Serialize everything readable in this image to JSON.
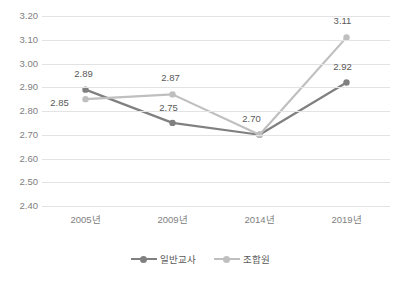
{
  "chart_data": {
    "type": "line",
    "title": "",
    "xlabel": "",
    "ylabel": "",
    "categories": [
      "2005년",
      "2009년",
      "2014년",
      "2019년"
    ],
    "ylim": [
      2.4,
      3.2
    ],
    "ytick_step": 0.1,
    "ytick_labels": [
      "3.20",
      "3.10",
      "3.00",
      "2.90",
      "2.80",
      "2.70",
      "2.60",
      "2.50",
      "2.40"
    ],
    "grid": "horizontal",
    "legend_position": "bottom-center",
    "series": [
      {
        "name": "일반교사",
        "color": "#808080",
        "marker": "circle",
        "values": [
          2.89,
          2.75,
          2.7,
          2.92
        ],
        "labels": [
          "2.89",
          "2.75",
          "2.70",
          "2.92"
        ]
      },
      {
        "name": "조합원",
        "color": "#bfbfbf",
        "marker": "circle",
        "values": [
          2.85,
          2.87,
          2.7,
          3.11
        ],
        "labels": [
          "2.85",
          "2.87",
          "",
          "3.11"
        ]
      }
    ],
    "annotations": [
      {
        "text": "2.89",
        "series": "일반교사",
        "category": "2005년",
        "position": "above"
      },
      {
        "text": "2.85",
        "series": "조합원",
        "category": "2005년",
        "position": "left"
      },
      {
        "text": "2.75",
        "series": "일반교사",
        "category": "2009년",
        "position": "above-left"
      },
      {
        "text": "2.87",
        "series": "조합원",
        "category": "2009년",
        "position": "above"
      },
      {
        "text": "2.70",
        "series": "shared",
        "category": "2014년",
        "position": "above-left"
      },
      {
        "text": "2.92",
        "series": "일반교사",
        "category": "2019년",
        "position": "above-left"
      },
      {
        "text": "3.11",
        "series": "조합원",
        "category": "2019년",
        "position": "above"
      }
    ]
  },
  "axis": {
    "y_labels": [
      "3.20",
      "3.10",
      "3.00",
      "2.90",
      "2.80",
      "2.70",
      "2.60",
      "2.50",
      "2.40"
    ],
    "x_labels": [
      "2005년",
      "2009년",
      "2014년",
      "2019년"
    ]
  },
  "legend": {
    "items": [
      {
        "label": "일반교사",
        "color": "#808080"
      },
      {
        "label": "조합원",
        "color": "#bfbfbf"
      }
    ]
  },
  "labels": {
    "t2005_teacher": "2.89",
    "t2005_union": "2.85",
    "t2009_teacher": "2.75",
    "t2009_union": "2.87",
    "t2014_shared": "2.70",
    "t2019_teacher": "2.92",
    "t2019_union": "3.11"
  }
}
